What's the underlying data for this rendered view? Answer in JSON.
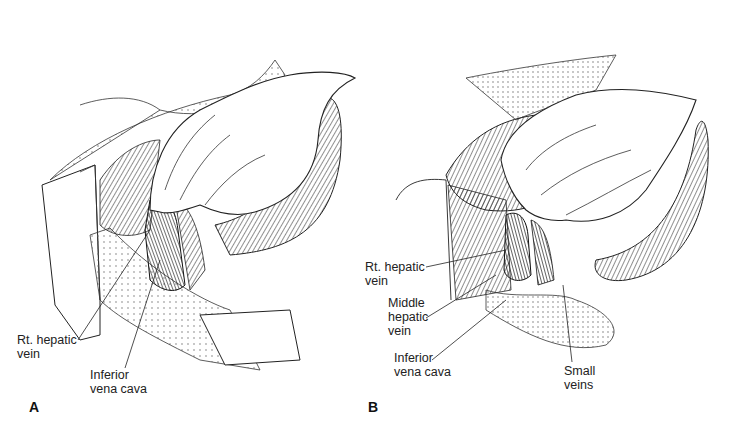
{
  "figure": {
    "panels": [
      {
        "letter": "A",
        "labels": {
          "rt_hepatic_vein": "Rt. hepatic\nvein",
          "inferior_vena_cava": "Inferior\nvena cava"
        }
      },
      {
        "letter": "B",
        "labels": {
          "rt_hepatic_vein": "Rt. hepatic\nvein",
          "middle_hepatic_vein": "Middle\nhepatic\nvein",
          "inferior_vena_cava": "Inferior\nvena cava",
          "small_veins": "Small\nveins"
        }
      }
    ],
    "colors": {
      "ink": "#1a1a1a",
      "background": "#ffffff"
    }
  }
}
